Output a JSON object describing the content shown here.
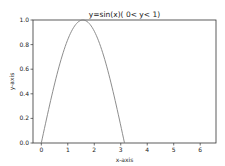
{
  "chart_data": {
    "type": "line",
    "title": "y=sin(x)( 0< y< 1)",
    "xlabel": "x-axis",
    "ylabel": "y-axis",
    "xlim": [
      -0.314,
      6.597
    ],
    "ylim": [
      0.0,
      1.0
    ],
    "x_ticks": [
      "0",
      "1",
      "2",
      "3",
      "4",
      "5",
      "6"
    ],
    "y_ticks": [
      "0.0",
      "0.2",
      "0.4",
      "0.6",
      "0.8",
      "1.0"
    ],
    "grid": false,
    "legend": null,
    "series": [
      {
        "name": "sin(x)",
        "color": "#808080",
        "x": [
          0,
          0.2,
          0.4,
          0.6,
          0.8,
          1.0,
          1.2,
          1.4,
          1.571,
          1.8,
          2.0,
          2.2,
          2.4,
          2.6,
          2.8,
          3.0,
          3.1416
        ],
        "y": [
          0,
          0.199,
          0.389,
          0.565,
          0.717,
          0.841,
          0.932,
          0.985,
          1.0,
          0.974,
          0.909,
          0.808,
          0.675,
          0.516,
          0.335,
          0.141,
          0
        ]
      }
    ]
  }
}
